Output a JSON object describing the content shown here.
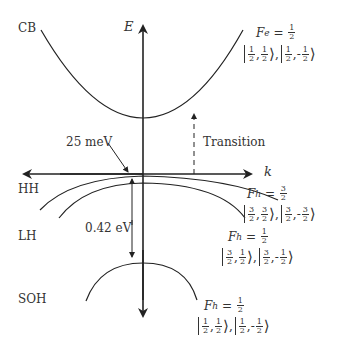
{
  "diagram": {
    "axes": {
      "vertical_label": "E",
      "horizontal_label": "k"
    },
    "bands": [
      {
        "name": "CB",
        "label": "CB"
      },
      {
        "name": "HH",
        "label": "HH"
      },
      {
        "name": "LH",
        "label": "LH"
      },
      {
        "name": "SOH",
        "label": "SOH"
      }
    ],
    "annotations": {
      "split_hh_lh": "25 meV",
      "split_so": "0.42 eV",
      "transition": "Transition"
    },
    "states": {
      "cb": {
        "F_symbol": "F",
        "F_sub": "e",
        "F_value": {
          "num": "1",
          "den": "2"
        },
        "kets": [
          {
            "j": {
              "num": "1",
              "den": "2"
            },
            "m": {
              "sign": "",
              "num": "1",
              "den": "2"
            }
          },
          {
            "j": {
              "num": "1",
              "den": "2"
            },
            "m": {
              "sign": "-",
              "num": "1",
              "den": "2"
            }
          }
        ]
      },
      "hh": {
        "F_symbol": "F",
        "F_sub": "h",
        "F_value": {
          "num": "3",
          "den": "2"
        },
        "kets": [
          {
            "j": {
              "num": "3",
              "den": "2"
            },
            "m": {
              "sign": "",
              "num": "3",
              "den": "2"
            }
          },
          {
            "j": {
              "num": "3",
              "den": "2"
            },
            "m": {
              "sign": "-",
              "num": "3",
              "den": "2"
            }
          }
        ]
      },
      "lh": {
        "F_symbol": "F",
        "F_sub": "h",
        "F_value": {
          "num": "1",
          "den": "2"
        },
        "kets": [
          {
            "j": {
              "num": "3",
              "den": "2"
            },
            "m": {
              "sign": "",
              "num": "1",
              "den": "2"
            }
          },
          {
            "j": {
              "num": "3",
              "den": "2"
            },
            "m": {
              "sign": "-",
              "num": "1",
              "den": "2"
            }
          }
        ]
      },
      "soh": {
        "F_symbol": "F",
        "F_sub": "h",
        "F_value": {
          "num": "1",
          "den": "2"
        },
        "kets": [
          {
            "j": {
              "num": "1",
              "den": "2"
            },
            "m": {
              "sign": "",
              "num": "1",
              "den": "2"
            }
          },
          {
            "j": {
              "num": "1",
              "den": "2"
            },
            "m": {
              "sign": "-",
              "num": "1",
              "den": "2"
            }
          }
        ]
      }
    },
    "colors": {
      "line": "#222222",
      "text": "#333333",
      "background": "#ffffff"
    }
  }
}
